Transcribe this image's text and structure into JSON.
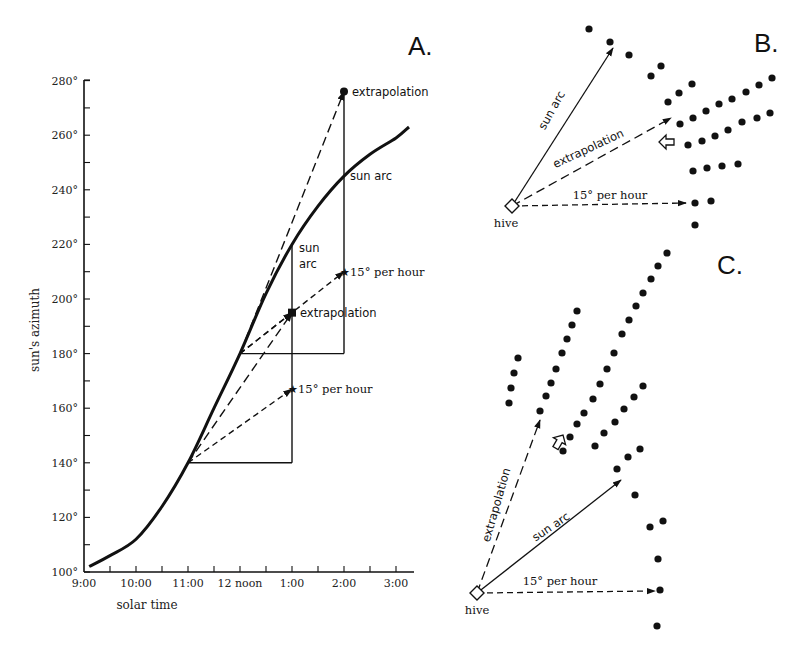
{
  "figure": {
    "panels": {
      "A": {
        "letter": "A."
      },
      "B": {
        "letter": "B."
      },
      "C": {
        "letter": "C."
      }
    }
  },
  "chart_data": {
    "type": "line",
    "title": "",
    "xlabel": "solar time",
    "ylabel": "sun's azimuth",
    "x_ticks": [
      "9:00",
      "10:00",
      "11:00",
      "12 noon",
      "1:00",
      "2:00",
      "3:00"
    ],
    "y_ticks": [
      "100°",
      "120°",
      "140°",
      "160°",
      "180°",
      "200°",
      "220°",
      "240°",
      "260°",
      "280°"
    ],
    "xlim_hours": [
      9,
      15.33
    ],
    "ylim": [
      100,
      280
    ],
    "grid": false,
    "series": [
      {
        "name": "sun arc",
        "x_hours": [
          9.1,
          9.5,
          10.0,
          10.5,
          11.0,
          11.5,
          12.0,
          12.5,
          13.0,
          13.5,
          14.0,
          14.5,
          15.0,
          15.25
        ],
        "values": [
          102,
          106,
          112,
          124,
          140,
          160,
          180,
          202,
          220,
          234,
          245,
          253,
          259,
          263
        ]
      }
    ],
    "constructions": [
      {
        "from": [
          11,
          140
        ],
        "to": [
          13,
          140
        ],
        "style": "solid",
        "role": "hour-base"
      },
      {
        "from": [
          13,
          140
        ],
        "to": [
          13,
          220
        ],
        "style": "solid",
        "role": "hour-vertical"
      },
      {
        "from": [
          12,
          180
        ],
        "to": [
          14,
          180
        ],
        "style": "solid",
        "role": "hour-base"
      },
      {
        "from": [
          14,
          180
        ],
        "to": [
          14,
          276
        ],
        "style": "solid",
        "role": "hour-vertical"
      },
      {
        "from": [
          11,
          140
        ],
        "to": [
          13,
          195
        ],
        "style": "long-dash",
        "role": "extrapolation"
      },
      {
        "from": [
          11,
          140
        ],
        "to": [
          13,
          167
        ],
        "style": "short-dash",
        "role": "15° per hour"
      },
      {
        "from": [
          12,
          180
        ],
        "to": [
          14,
          276
        ],
        "style": "long-dash",
        "role": "extrapolation"
      },
      {
        "from": [
          12,
          180
        ],
        "to": [
          14,
          210
        ],
        "style": "short-dash",
        "role": "15° per hour"
      },
      {
        "from": [
          12,
          180
        ],
        "to": [
          13,
          195
        ],
        "style": "short-dash",
        "role": "15° per hour"
      }
    ],
    "annotations": [
      {
        "text": "extrapolation",
        "at": [
          14,
          276
        ],
        "marker": "dot"
      },
      {
        "text": "sun arc",
        "at": [
          14,
          245
        ],
        "marker": "tick"
      },
      {
        "text": "15° per hour",
        "at": [
          14,
          210
        ],
        "marker": "star"
      },
      {
        "text": "sun",
        "at": [
          13,
          220
        ],
        "marker": "tick"
      },
      {
        "text": "arc",
        "at": [
          13,
          220
        ],
        "marker": "none"
      },
      {
        "text": "extrapolation",
        "at": [
          13,
          195
        ],
        "marker": "square"
      },
      {
        "text": "15° per hour",
        "at": [
          13,
          167
        ],
        "marker": "star"
      }
    ]
  },
  "labels": {
    "extrapolation": "extrapolation",
    "sun_arc": "sun arc",
    "sun": "sun",
    "arc": "arc",
    "per_hour": "15° per hour",
    "hive": "hive"
  },
  "panelB": {
    "hive": [
      512,
      206
    ],
    "arrows": [
      {
        "name": "sun-arc-arrow",
        "to": [
          613,
          48
        ],
        "style": "solid",
        "label": "sun arc"
      },
      {
        "name": "extrapolation-arrow",
        "to": [
          671,
          118
        ],
        "style": "long-dash",
        "label": "extrapolation"
      },
      {
        "name": "per-hour-arrow",
        "to": [
          686,
          203
        ],
        "style": "short-dash",
        "label": "15° per hour"
      }
    ],
    "hollow_arrow": [
      667,
      142
    ],
    "dots": [
      [
        589,
        29
      ],
      [
        610,
        42
      ],
      [
        629,
        55
      ],
      [
        651,
        76
      ],
      [
        661,
        66
      ],
      [
        668,
        102
      ],
      [
        679,
        93
      ],
      [
        692,
        84
      ],
      [
        680,
        124
      ],
      [
        693,
        118
      ],
      [
        706,
        111
      ],
      [
        719,
        104
      ],
      [
        732,
        99
      ],
      [
        746,
        92
      ],
      [
        759,
        85
      ],
      [
        772,
        78
      ],
      [
        688,
        145
      ],
      [
        702,
        141
      ],
      [
        715,
        136
      ],
      [
        728,
        130
      ],
      [
        742,
        122
      ],
      [
        757,
        118
      ],
      [
        770,
        113
      ],
      [
        693,
        171
      ],
      [
        707,
        168
      ],
      [
        722,
        166
      ],
      [
        738,
        164
      ],
      [
        695,
        203
      ],
      [
        711,
        201
      ],
      [
        695,
        225
      ]
    ]
  },
  "panelC": {
    "hive": [
      477,
      593
    ],
    "arrows": [
      {
        "name": "extrapolation-arrow",
        "to": [
          540,
          420
        ],
        "style": "long-dash",
        "label": "extrapolation"
      },
      {
        "name": "sun-arc-arrow",
        "to": [
          621,
          480
        ],
        "style": "solid",
        "label": "sun arc"
      },
      {
        "name": "per-hour-arrow",
        "to": [
          655,
          591
        ],
        "style": "short-dash",
        "label": "15° per hour"
      }
    ],
    "hollow_arrow": [
      559,
      442
    ],
    "dots": [
      [
        518,
        358
      ],
      [
        514,
        373
      ],
      [
        511,
        388
      ],
      [
        509,
        403
      ],
      [
        577,
        311
      ],
      [
        572,
        325
      ],
      [
        567,
        339
      ],
      [
        562,
        353
      ],
      [
        556,
        369
      ],
      [
        551,
        383
      ],
      [
        546,
        396
      ],
      [
        540,
        411
      ],
      [
        667,
        253
      ],
      [
        658,
        266
      ],
      [
        651,
        279
      ],
      [
        643,
        293
      ],
      [
        636,
        306
      ],
      [
        629,
        320
      ],
      [
        622,
        334
      ],
      [
        614,
        353
      ],
      [
        607,
        369
      ],
      [
        600,
        384
      ],
      [
        593,
        399
      ],
      [
        584,
        413
      ],
      [
        577,
        424
      ],
      [
        570,
        437
      ],
      [
        563,
        451
      ],
      [
        643,
        386
      ],
      [
        634,
        397
      ],
      [
        624,
        409
      ],
      [
        615,
        422
      ],
      [
        604,
        433
      ],
      [
        595,
        446
      ],
      [
        640,
        449
      ],
      [
        628,
        457
      ],
      [
        617,
        469
      ],
      [
        635,
        495
      ],
      [
        650,
        527
      ],
      [
        663,
        521
      ],
      [
        658,
        559
      ],
      [
        660,
        590
      ],
      [
        657,
        626
      ]
    ]
  }
}
